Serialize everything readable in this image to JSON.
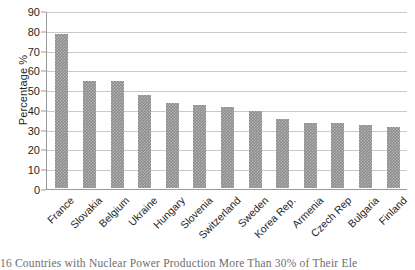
{
  "chart_data": {
    "type": "bar",
    "title": "",
    "xlabel": "",
    "ylabel": "Percentage %",
    "ylim": [
      0,
      90
    ],
    "ytick_step": 10,
    "yticks": [
      90,
      80,
      70,
      60,
      50,
      40,
      30,
      20,
      10,
      0
    ],
    "grid": true,
    "legend": false,
    "bar_color": "#8d8d8d",
    "categories": [
      "France",
      "Slovakia",
      "Belgium",
      "Ukraine",
      "Hungary",
      "Slovenia",
      "Switzerland",
      "Sweden",
      "Korea Rep.",
      "Armenia",
      "Czech Rep",
      "Bulgaria",
      "Finland"
    ],
    "values": [
      78,
      54,
      54,
      47,
      43,
      42,
      41,
      39,
      35,
      33,
      33,
      32,
      31
    ]
  },
  "caption": {
    "text": "16 Countries with Nuclear Power Production More Than 30% of Their Ele"
  }
}
